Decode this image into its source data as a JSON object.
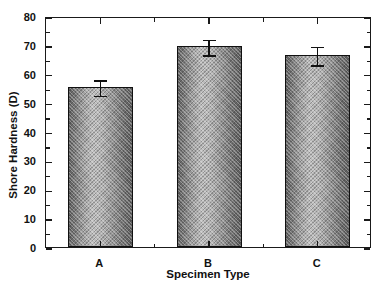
{
  "chart_data": {
    "type": "bar",
    "title": "",
    "xlabel": "Specimen Type",
    "ylabel": "Shore Hardness (D)",
    "categories": [
      "A",
      "B",
      "C"
    ],
    "values": [
      55.5,
      69.5,
      66.5
    ],
    "errors": [
      3.0,
      3.0,
      3.5
    ],
    "series": [
      {
        "name": "Shore Hardness (D)",
        "values": [
          55.5,
          69.5,
          66.5
        ],
        "errors": [
          3.0,
          3.0,
          3.5
        ]
      }
    ],
    "ylim": [
      0,
      80
    ],
    "ytick_step": 10,
    "yminor_step": 5,
    "ytick_labels": [
      "0",
      "10",
      "20",
      "30",
      "40",
      "50",
      "60",
      "70",
      "80"
    ],
    "grid": false,
    "legend": false,
    "bar_color": "#9a9a9a",
    "edge_color": "#111111",
    "error_color": "#111111",
    "frame_color": "#1a1a1a"
  },
  "axis": {
    "y_title": "Shore Hardness (D)",
    "x_title": "Specimen Type",
    "y_ticks": [
      "0",
      "10",
      "20",
      "30",
      "40",
      "50",
      "60",
      "70",
      "80"
    ],
    "x_ticks": [
      "A",
      "B",
      "C"
    ]
  }
}
